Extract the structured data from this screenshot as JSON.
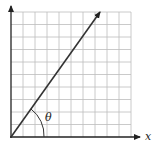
{
  "diagram": {
    "type": "angle-on-grid",
    "grid": {
      "columns": 10,
      "rows": 10,
      "line_color": "#b8b8b8"
    },
    "axes": {
      "x_label": "x",
      "color": "#222222"
    },
    "vector": {
      "from": [
        0,
        0
      ],
      "to": [
        7.5,
        10.5
      ],
      "color": "#333333"
    },
    "angle": {
      "label": "θ",
      "description": "angle between vector and positive x-axis"
    }
  }
}
